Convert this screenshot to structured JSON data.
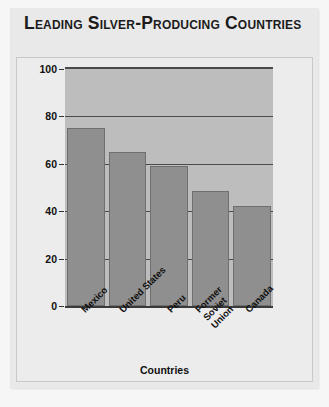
{
  "title": "Leading Silver-Producing Countries",
  "chart_data": {
    "type": "bar",
    "title": "Leading Silver-Producing Countries",
    "xlabel": "Countries",
    "ylabel": "Millions of Troy Ounces",
    "categories": [
      "Mexico",
      "United States",
      "Peru",
      "Former Soviet Union",
      "Canada"
    ],
    "values": [
      75,
      65,
      59,
      48.5,
      42
    ],
    "ylim": [
      0,
      100
    ],
    "yticks": [
      0,
      20,
      40,
      60,
      80,
      100
    ],
    "ytick_labels": [
      "0",
      "20",
      "40",
      "60",
      "80",
      "100"
    ],
    "grid": true,
    "legend": false,
    "bar_color": "#8f8f8f",
    "plot_background": "#bdbdbd",
    "panel_background": "#e9e9e9",
    "axis_color": "#4a4a4a"
  }
}
